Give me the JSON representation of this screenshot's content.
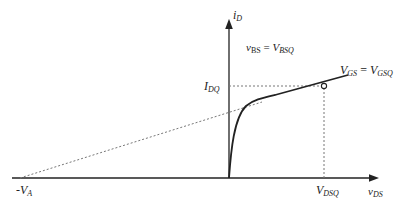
{
  "diagram": {
    "colors": {
      "axis": "#222222",
      "curve": "#222222",
      "dashed": "#666666",
      "background": "#ffffff"
    },
    "labels": {
      "y_axis": {
        "main": "i",
        "sub": "D"
      },
      "x_axis": {
        "main": "v",
        "sub": "DS"
      },
      "vbs": {
        "left_main": "v",
        "left_sub": "BS",
        "eq": " = ",
        "right_main": "V",
        "right_sub": "BSQ"
      },
      "vgs": {
        "left_main": "V",
        "left_sub": "GS",
        "eq": " = ",
        "right_main": "V",
        "right_sub": "GSQ"
      },
      "idq": {
        "main": "I",
        "sub": "DQ"
      },
      "vdsq": {
        "main": "V",
        "sub": "DSQ"
      },
      "va": {
        "main": "-V",
        "sub": "A"
      }
    },
    "points": {
      "origin": [
        229,
        178
      ],
      "q_point": [
        324,
        86
      ],
      "minus_va": [
        20,
        178
      ]
    }
  }
}
